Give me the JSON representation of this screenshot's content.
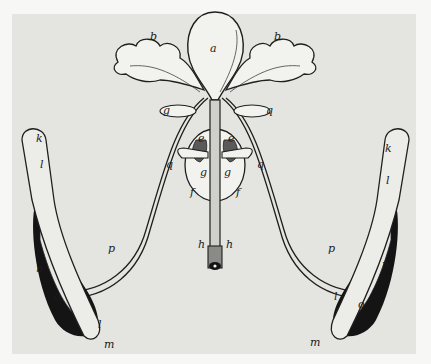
{
  "figure": {
    "kind": "anatomical engraving",
    "colors": {
      "paper": "#f7f7f5",
      "plate": "#e4e4e1",
      "ink": "#1f1f1f",
      "fill": "#f2f2ef",
      "dark": "#141414"
    },
    "labels": {
      "a": "a",
      "b_left": "b",
      "b_right": "b",
      "g_top_left": "g",
      "q_top_right": "q",
      "e_left": "e",
      "e_right": "e",
      "q_left": "q",
      "q_right": "q",
      "g_left": "g",
      "g_right": "g",
      "f_left": "f",
      "f_right": "f",
      "h_left": "h",
      "h_right": "h",
      "k_left": "k",
      "k_right": "k",
      "l_left_top": "l",
      "l_left_bottom": "l",
      "l_right_top": "l",
      "l_right_bottom": "l",
      "n_left": "n",
      "n_right": "n",
      "o_left": "o",
      "o_right": "o",
      "p_left": "p",
      "p_right": "p",
      "m_left": "m",
      "m_right": "m"
    }
  }
}
